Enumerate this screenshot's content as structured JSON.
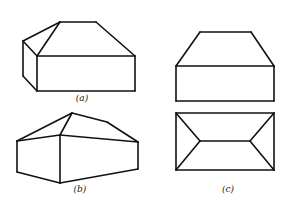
{
  "figure": {
    "stroke_color": "#111111",
    "background": "#ffffff",
    "panels": [
      {
        "id": "a",
        "caption": "(a)",
        "description": "Oblique view of a rectangular box with a hipped roof (hip on left end, sloped right end)",
        "caption_pos": [
          82,
          99
        ],
        "lines": [
          [
            [
              37,
              56
            ],
            [
              135,
              56
            ]
          ],
          [
            [
              135,
              56
            ],
            [
              135,
              91
            ]
          ],
          [
            [
              135,
              91
            ],
            [
              37,
              91
            ]
          ],
          [
            [
              37,
              91
            ],
            [
              37,
              56
            ]
          ],
          [
            [
              37,
              56
            ],
            [
              23,
              41
            ]
          ],
          [
            [
              23,
              41
            ],
            [
              23,
              76
            ]
          ],
          [
            [
              23,
              76
            ],
            [
              37,
              91
            ]
          ],
          [
            [
              23,
              41
            ],
            [
              60,
              22
            ]
          ],
          [
            [
              60,
              22
            ],
            [
              37,
              56
            ]
          ],
          [
            [
              60,
              22
            ],
            [
              96,
              22
            ]
          ],
          [
            [
              96,
              22
            ],
            [
              135,
              56
            ]
          ]
        ]
      },
      {
        "id": "b",
        "caption": "(b)",
        "description": "Perspective view of a box with a hipped roof, viewed from a corner",
        "caption_pos": [
          80,
          190
        ],
        "lines": [
          [
            [
              17,
              141
            ],
            [
              60,
              135
            ]
          ],
          [
            [
              60,
              135
            ],
            [
              138,
              142
            ]
          ],
          [
            [
              17,
              141
            ],
            [
              17,
              172
            ]
          ],
          [
            [
              60,
              135
            ],
            [
              60,
              183
            ]
          ],
          [
            [
              138,
              142
            ],
            [
              138,
              169
            ]
          ],
          [
            [
              17,
              172
            ],
            [
              60,
              183
            ]
          ],
          [
            [
              60,
              183
            ],
            [
              138,
              169
            ]
          ],
          [
            [
              17,
              141
            ],
            [
              72,
              113
            ]
          ],
          [
            [
              72,
              113
            ],
            [
              60,
              135
            ]
          ],
          [
            [
              72,
              113
            ],
            [
              107,
              122
            ]
          ],
          [
            [
              107,
              122
            ],
            [
              138,
              142
            ]
          ]
        ]
      },
      {
        "id": "c",
        "caption": "(c)",
        "description": "Orthographic front elevation and top plan of the hipped-roof box",
        "caption_pos": [
          228,
          190
        ],
        "lines": [
          [
            [
              200,
              32
            ],
            [
              251,
              32
            ]
          ],
          [
            [
              200,
              32
            ],
            [
              176,
              66
            ]
          ],
          [
            [
              251,
              32
            ],
            [
              274,
              66
            ]
          ],
          [
            [
              176,
              66
            ],
            [
              274,
              66
            ]
          ],
          [
            [
              176,
              66
            ],
            [
              176,
              101
            ]
          ],
          [
            [
              274,
              66
            ],
            [
              274,
              101
            ]
          ],
          [
            [
              176,
              101
            ],
            [
              274,
              101
            ]
          ],
          [
            [
              176,
              113
            ],
            [
              274,
              113
            ]
          ],
          [
            [
              274,
              113
            ],
            [
              274,
              170
            ]
          ],
          [
            [
              274,
              170
            ],
            [
              176,
              170
            ]
          ],
          [
            [
              176,
              170
            ],
            [
              176,
              113
            ]
          ],
          [
            [
              200,
              141
            ],
            [
              250,
              141
            ]
          ],
          [
            [
              176,
              113
            ],
            [
              200,
              141
            ]
          ],
          [
            [
              176,
              170
            ],
            [
              200,
              141
            ]
          ],
          [
            [
              274,
              113
            ],
            [
              250,
              141
            ]
          ],
          [
            [
              274,
              170
            ],
            [
              250,
              141
            ]
          ]
        ]
      }
    ]
  }
}
